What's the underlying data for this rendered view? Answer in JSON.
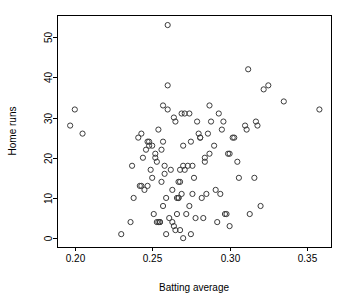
{
  "chart_data": {
    "type": "scatter",
    "title": "",
    "xlabel": "Batting average",
    "ylabel": "Home runs",
    "xlim": [
      0.1885,
      0.3655
    ],
    "ylim": [
      -2.2,
      55.5
    ],
    "xticks": [
      0.2,
      0.25,
      0.3,
      0.35
    ],
    "xtick_labels": [
      "0.20",
      "0.25",
      "0.30",
      "0.35"
    ],
    "yticks": [
      0,
      10,
      20,
      30,
      40,
      50
    ],
    "ytick_labels": [
      "0",
      "10",
      "20",
      "30",
      "40",
      "50"
    ],
    "grid": false,
    "legend": null,
    "marker": "open-circle",
    "marker_color": "#3b3b3b",
    "marker_radius_px": 2.6,
    "points": [
      [
        0.197,
        28
      ],
      [
        0.2,
        32
      ],
      [
        0.205,
        26
      ],
      [
        0.23,
        1
      ],
      [
        0.236,
        4
      ],
      [
        0.237,
        18
      ],
      [
        0.238,
        10
      ],
      [
        0.241,
        25
      ],
      [
        0.242,
        13
      ],
      [
        0.243,
        26
      ],
      [
        0.243,
        13
      ],
      [
        0.244,
        20
      ],
      [
        0.245,
        12
      ],
      [
        0.246,
        22
      ],
      [
        0.247,
        13
      ],
      [
        0.247,
        24
      ],
      [
        0.248,
        24
      ],
      [
        0.248,
        23
      ],
      [
        0.249,
        17
      ],
      [
        0.25,
        23
      ],
      [
        0.25,
        15
      ],
      [
        0.251,
        6
      ],
      [
        0.252,
        20
      ],
      [
        0.252,
        21
      ],
      [
        0.253,
        19
      ],
      [
        0.253,
        4
      ],
      [
        0.254,
        4
      ],
      [
        0.254,
        27
      ],
      [
        0.255,
        4
      ],
      [
        0.255,
        4
      ],
      [
        0.256,
        14
      ],
      [
        0.256,
        22
      ],
      [
        0.257,
        33
      ],
      [
        0.257,
        24
      ],
      [
        0.257,
        8
      ],
      [
        0.258,
        18
      ],
      [
        0.258,
        16
      ],
      [
        0.259,
        1
      ],
      [
        0.259,
        10
      ],
      [
        0.26,
        53
      ],
      [
        0.26,
        38
      ],
      [
        0.26,
        32
      ],
      [
        0.261,
        5
      ],
      [
        0.262,
        17
      ],
      [
        0.263,
        12
      ],
      [
        0.263,
        4
      ],
      [
        0.264,
        3
      ],
      [
        0.264,
        30
      ],
      [
        0.265,
        29
      ],
      [
        0.265,
        2
      ],
      [
        0.266,
        6
      ],
      [
        0.266,
        10
      ],
      [
        0.267,
        10
      ],
      [
        0.267,
        10
      ],
      [
        0.267,
        14
      ],
      [
        0.268,
        14
      ],
      [
        0.268,
        17
      ],
      [
        0.268,
        2
      ],
      [
        0.269,
        31
      ],
      [
        0.269,
        11
      ],
      [
        0.27,
        18
      ],
      [
        0.27,
        23
      ],
      [
        0.27,
        0
      ],
      [
        0.271,
        31
      ],
      [
        0.271,
        17
      ],
      [
        0.272,
        6
      ],
      [
        0.273,
        18
      ],
      [
        0.274,
        31
      ],
      [
        0.274,
        8
      ],
      [
        0.275,
        24
      ],
      [
        0.275,
        1
      ],
      [
        0.276,
        18
      ],
      [
        0.276,
        11
      ],
      [
        0.277,
        15
      ],
      [
        0.278,
        5
      ],
      [
        0.279,
        29
      ],
      [
        0.28,
        26
      ],
      [
        0.281,
        25
      ],
      [
        0.281,
        25
      ],
      [
        0.282,
        10
      ],
      [
        0.283,
        5
      ],
      [
        0.284,
        19
      ],
      [
        0.284,
        20
      ],
      [
        0.285,
        11
      ],
      [
        0.286,
        26
      ],
      [
        0.287,
        33
      ],
      [
        0.287,
        21
      ],
      [
        0.288,
        29
      ],
      [
        0.29,
        23
      ],
      [
        0.291,
        12
      ],
      [
        0.292,
        4
      ],
      [
        0.293,
        31
      ],
      [
        0.294,
        11
      ],
      [
        0.295,
        27
      ],
      [
        0.296,
        29
      ],
      [
        0.297,
        6
      ],
      [
        0.298,
        6
      ],
      [
        0.299,
        21
      ],
      [
        0.3,
        21
      ],
      [
        0.3,
        3
      ],
      [
        0.302,
        25
      ],
      [
        0.303,
        25
      ],
      [
        0.305,
        19
      ],
      [
        0.306,
        15
      ],
      [
        0.31,
        28
      ],
      [
        0.311,
        27
      ],
      [
        0.312,
        42
      ],
      [
        0.313,
        6
      ],
      [
        0.316,
        15
      ],
      [
        0.317,
        29
      ],
      [
        0.318,
        28
      ],
      [
        0.32,
        8
      ],
      [
        0.322,
        37
      ],
      [
        0.325,
        38
      ],
      [
        0.335,
        34
      ],
      [
        0.358,
        32
      ]
    ]
  },
  "geometry": {
    "plot_left": 57,
    "plot_right": 331,
    "plot_top": 15,
    "plot_bottom": 247,
    "tick_len": 4
  }
}
